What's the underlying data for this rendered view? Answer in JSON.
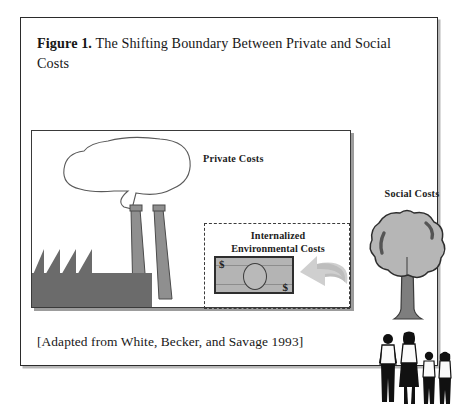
{
  "figure": {
    "label": "Figure 1.",
    "title": " The Shifting Boundary Between Private and Social Costs",
    "source_caption": "[Adapted from White, Becker, and Savage 1993]"
  },
  "diagram": {
    "private_costs_label": "Private Costs",
    "internalized_label_line1": "Internalized",
    "internalized_label_line2": "Environmental Costs",
    "social_costs_label": "Social Costs",
    "money_symbol_left": "$",
    "money_symbol_right": "$"
  },
  "icons": {
    "factory": "factory-icon",
    "smoke_cloud": "smoke-cloud-icon",
    "smokestack": "smokestack-icon",
    "tree": "tree-icon",
    "people": "people-group-icon",
    "arrow": "curved-arrow-icon",
    "dollar_bill": "dollar-bill-icon"
  },
  "colors": {
    "frame_border": "#2b2b2b",
    "panel_border": "#3a3a3a",
    "factory_gray": "#6b6b6b",
    "stack_gray": "#8f8f8f",
    "bill_gray": "#b4b4b4",
    "tree_canopy": "#b6b6b6",
    "tree_trunk": "#7e7e7e",
    "arrow_gray": "#cfcfcf",
    "shadow_gray": "#9c9c9c",
    "text": "#171717"
  }
}
